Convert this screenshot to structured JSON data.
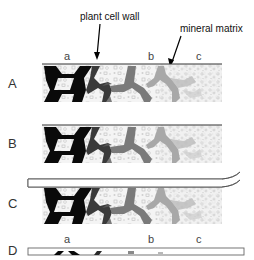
{
  "annotations": {
    "cell_wall": "plant cell wall",
    "mineral_matrix": "mineral matrix"
  },
  "panels": [
    {
      "label": "A",
      "sublabels": [
        "a",
        "b",
        "c"
      ]
    },
    {
      "label": "B"
    },
    {
      "label": "C"
    },
    {
      "label": "D",
      "sublabels": [
        "a",
        "b",
        "c"
      ]
    }
  ],
  "colors": {
    "wall_dark": "#0a0a0a",
    "wall_mid_dark": "#3a3a3a",
    "wall_mid": "#7a7a7a",
    "wall_light": "#a8a8a8",
    "matrix": "#c8c8c8",
    "surface_line": "#333333"
  }
}
